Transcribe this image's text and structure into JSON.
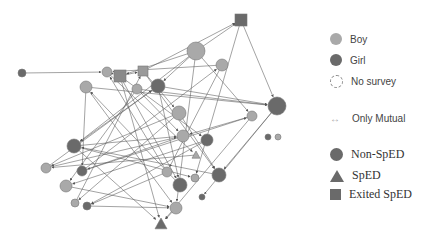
{
  "legend": {
    "gender": [
      {
        "label": "Boy",
        "color": "#a9a9a9"
      },
      {
        "label": "Girl",
        "color": "#6a6a6a"
      },
      {
        "label": "No survey",
        "color": "#ffffff"
      }
    ],
    "mutual": {
      "label": "Only Mutual",
      "icon": "double-arrow-icon"
    },
    "status": [
      {
        "label": "Non-SpED",
        "shape": "circle"
      },
      {
        "label": "SpED",
        "shape": "triangle"
      },
      {
        "label": "Exited SpED",
        "shape": "square"
      }
    ]
  },
  "graph": {
    "nodes": [
      {
        "id": "n1",
        "x": 241,
        "y": 20,
        "r": 6,
        "shape": "square",
        "fill": "#6a6a6a"
      },
      {
        "id": "n2",
        "x": 196,
        "y": 51,
        "r": 9,
        "shape": "circle",
        "fill": "#a9a9a9"
      },
      {
        "id": "n3",
        "x": 222,
        "y": 65,
        "r": 6,
        "shape": "circle",
        "fill": "#a9a9a9"
      },
      {
        "id": "n4",
        "x": 22,
        "y": 73,
        "r": 4,
        "shape": "circle",
        "fill": "#6a6a6a"
      },
      {
        "id": "n5",
        "x": 107,
        "y": 72,
        "r": 5,
        "shape": "circle",
        "fill": "#a9a9a9"
      },
      {
        "id": "n6",
        "x": 120,
        "y": 76,
        "r": 6,
        "shape": "square",
        "fill": "#8a8a8a"
      },
      {
        "id": "n7",
        "x": 143,
        "y": 71,
        "r": 5,
        "shape": "square",
        "fill": "#9a9a9a"
      },
      {
        "id": "n8",
        "x": 86,
        "y": 87,
        "r": 6,
        "shape": "circle",
        "fill": "#a9a9a9"
      },
      {
        "id": "n9",
        "x": 137,
        "y": 89,
        "r": 5,
        "shape": "circle",
        "fill": "#a9a9a9"
      },
      {
        "id": "n10",
        "x": 158,
        "y": 86,
        "r": 7,
        "shape": "circle",
        "fill": "#6a6a6a"
      },
      {
        "id": "n11",
        "x": 277,
        "y": 106,
        "r": 9,
        "shape": "circle",
        "fill": "#6a6a6a"
      },
      {
        "id": "n12",
        "x": 252,
        "y": 116,
        "r": 5,
        "shape": "circle",
        "fill": "#a9a9a9"
      },
      {
        "id": "n13",
        "x": 179,
        "y": 113,
        "r": 7,
        "shape": "circle",
        "fill": "#a9a9a9"
      },
      {
        "id": "n14",
        "x": 268,
        "y": 137,
        "r": 3,
        "shape": "circle",
        "fill": "#6a6a6a"
      },
      {
        "id": "n15",
        "x": 278,
        "y": 137,
        "r": 3,
        "shape": "circle",
        "fill": "#a9a9a9"
      },
      {
        "id": "n16",
        "x": 74,
        "y": 146,
        "r": 7,
        "shape": "circle",
        "fill": "#6a6a6a"
      },
      {
        "id": "n17",
        "x": 183,
        "y": 136,
        "r": 6,
        "shape": "circle",
        "fill": "#a9a9a9"
      },
      {
        "id": "n18",
        "x": 207,
        "y": 140,
        "r": 6,
        "shape": "circle",
        "fill": "#6a6a6a"
      },
      {
        "id": "n19",
        "x": 196,
        "y": 155,
        "r": 4,
        "shape": "triangle",
        "fill": "#a9a9a9"
      },
      {
        "id": "n20",
        "x": 46,
        "y": 168,
        "r": 5,
        "shape": "circle",
        "fill": "#a9a9a9"
      },
      {
        "id": "n21",
        "x": 82,
        "y": 171,
        "r": 5,
        "shape": "circle",
        "fill": "#6a6a6a"
      },
      {
        "id": "n22",
        "x": 167,
        "y": 172,
        "r": 5,
        "shape": "circle",
        "fill": "#a9a9a9"
      },
      {
        "id": "n23",
        "x": 195,
        "y": 178,
        "r": 4,
        "shape": "circle",
        "fill": "#a9a9a9"
      },
      {
        "id": "n24",
        "x": 219,
        "y": 175,
        "r": 7,
        "shape": "circle",
        "fill": "#6a6a6a"
      },
      {
        "id": "n25",
        "x": 66,
        "y": 186,
        "r": 6,
        "shape": "circle",
        "fill": "#a9a9a9"
      },
      {
        "id": "n26",
        "x": 180,
        "y": 185,
        "r": 7,
        "shape": "circle",
        "fill": "#6a6a6a"
      },
      {
        "id": "n27",
        "x": 75,
        "y": 203,
        "r": 4,
        "shape": "circle",
        "fill": "#a9a9a9"
      },
      {
        "id": "n28",
        "x": 87,
        "y": 206,
        "r": 4,
        "shape": "circle",
        "fill": "#6a6a6a"
      },
      {
        "id": "n29",
        "x": 202,
        "y": 197,
        "r": 3,
        "shape": "circle",
        "fill": "#6a6a6a"
      },
      {
        "id": "n30",
        "x": 176,
        "y": 208,
        "r": 6,
        "shape": "circle",
        "fill": "#a9a9a9"
      },
      {
        "id": "n31",
        "x": 161,
        "y": 224,
        "r": 6,
        "shape": "triangle",
        "fill": "#6a6a6a"
      }
    ],
    "edges": [
      [
        "n4",
        "n5"
      ],
      [
        "n5",
        "n6"
      ],
      [
        "n6",
        "n7"
      ],
      [
        "n7",
        "n1"
      ],
      [
        "n2",
        "n1"
      ],
      [
        "n1",
        "n11"
      ],
      [
        "n1",
        "n23"
      ],
      [
        "n2",
        "n6"
      ],
      [
        "n2",
        "n16"
      ],
      [
        "n2",
        "n30"
      ],
      [
        "n2",
        "n12"
      ],
      [
        "n3",
        "n22"
      ],
      [
        "n3",
        "n5"
      ],
      [
        "n6",
        "n18"
      ],
      [
        "n6",
        "n26"
      ],
      [
        "n7",
        "n24"
      ],
      [
        "n7",
        "n13"
      ],
      [
        "n8",
        "n21"
      ],
      [
        "n8",
        "n30"
      ],
      [
        "n9",
        "n25"
      ],
      [
        "n9",
        "n17"
      ],
      [
        "n10",
        "n11"
      ],
      [
        "n10",
        "n16"
      ],
      [
        "n10",
        "n26"
      ],
      [
        "n11",
        "n29"
      ],
      [
        "n11",
        "n24"
      ],
      [
        "n12",
        "n31"
      ],
      [
        "n12",
        "n17"
      ],
      [
        "n13",
        "n20"
      ],
      [
        "n13",
        "n27"
      ],
      [
        "n16",
        "n17"
      ],
      [
        "n16",
        "n31"
      ],
      [
        "n17",
        "n21"
      ],
      [
        "n18",
        "n25"
      ],
      [
        "n18",
        "n28"
      ],
      [
        "n19",
        "n20"
      ],
      [
        "n20",
        "n10"
      ],
      [
        "n21",
        "n3"
      ],
      [
        "n22",
        "n5"
      ],
      [
        "n22",
        "n28"
      ],
      [
        "n24",
        "n16"
      ],
      [
        "n25",
        "n30"
      ],
      [
        "n26",
        "n8"
      ],
      [
        "n27",
        "n7"
      ],
      [
        "n28",
        "n30"
      ],
      [
        "n30",
        "n31"
      ],
      [
        "n6",
        "n31"
      ],
      [
        "n5",
        "n19"
      ],
      [
        "n9",
        "n11"
      ],
      [
        "n13",
        "n24"
      ],
      [
        "n16",
        "n23"
      ],
      [
        "n21",
        "n12"
      ],
      [
        "n8",
        "n11"
      ],
      [
        "n2",
        "n10"
      ],
      [
        "n20",
        "n17"
      ]
    ]
  }
}
